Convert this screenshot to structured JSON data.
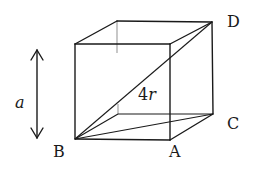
{
  "figure": {
    "type": "cube-unit-cell",
    "labels": {
      "B": "B",
      "A": "A",
      "C": "C",
      "D": "D",
      "edge": "a",
      "diagonal_num": "4",
      "diagonal_var": "r"
    },
    "annotations": {
      "edge_length_arrow": "double-headed vertical arrow indicating edge length a",
      "body_diagonal": "B to D labeled 4r"
    },
    "colors": {
      "line": "#1a1a1a",
      "hidden_line": "#9a9a9a",
      "background": "#ffffff"
    }
  }
}
